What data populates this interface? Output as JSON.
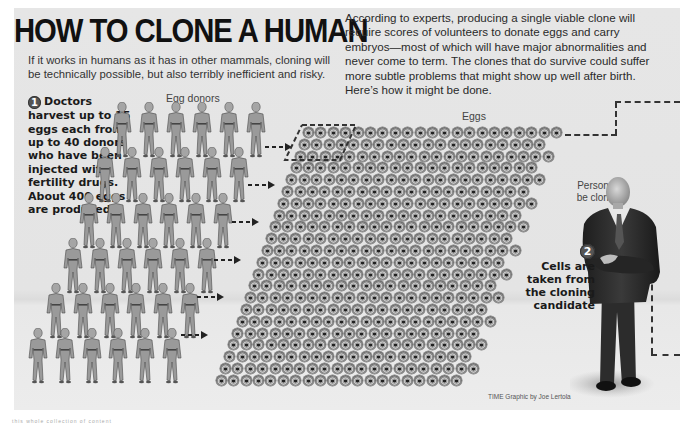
{
  "header": {
    "title": "HOW TO CLONE A HUMAN",
    "subtitle": "If it works in humans as it has in other mammals, cloning will be technically possible, but also terribly inefficient and risky.",
    "intro": "According to experts, producing a single viable clone will require scores of volunteers to donate eggs and carry embryos—most of which will have major abnormalities and never come to term. The clones that do survive could suffer more subtle problems that might show up well after birth. Here’s how it might be done."
  },
  "steps": [
    {
      "number": "1",
      "text": "Doctors harvest up to 15 eggs each from up to 40 donors who have been injected with fertility drugs. About 400 eggs are produced"
    },
    {
      "number": "2",
      "text": "Cells are taken from the cloning candidate"
    }
  ],
  "labels": {
    "egg_donors": "Egg donors",
    "eggs": "Eggs",
    "person_line1": "Person to",
    "person_line2": "be cloned"
  },
  "credit": "TIME Graphic by Joe Lertola",
  "footer_text": "this whole collection of content",
  "graphic": {
    "donor_rows": 6,
    "donors_per_row": 6,
    "egg_rows": 22,
    "eggs_per_row": 21,
    "colors": {
      "panel": "#e6e6e6",
      "title": "#111111",
      "dash": "#333333",
      "donor": "#9a9a9a",
      "suit": "#2b2b2b"
    }
  }
}
